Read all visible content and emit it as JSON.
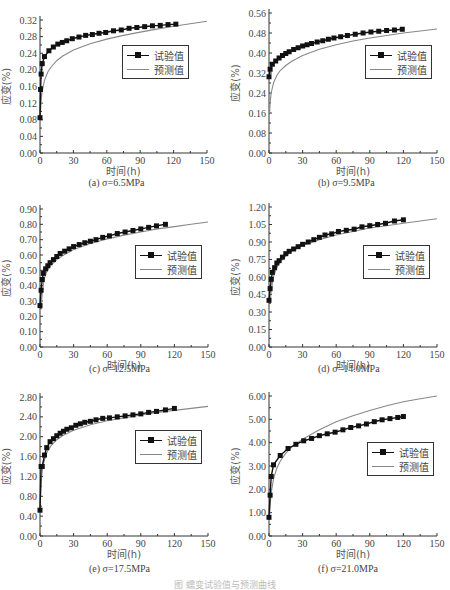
{
  "figure_caption": "图    蠕变试验值与预测曲线",
  "legend": {
    "experimental": "试验值",
    "predicted": "预测值"
  },
  "colors": {
    "experimental": "#111111",
    "predicted": "#888888",
    "axis": "#333333"
  },
  "panels": [
    {
      "caption_prefix": "(a)",
      "caption_sigma": "σ=6.5MPa",
      "ylabel": "应变(%)",
      "xlabel": "时间(h)"
    },
    {
      "caption_prefix": "(b)",
      "caption_sigma": "σ=9.5MPa",
      "ylabel": "应变(%)",
      "xlabel": "时间(h)"
    },
    {
      "caption_prefix": "(c)",
      "caption_sigma": "σ=12.5MPa",
      "ylabel": "应变(%)",
      "xlabel": "时间(h)"
    },
    {
      "caption_prefix": "(d)",
      "caption_sigma": "σ=14.0MPa",
      "ylabel": "应变(%)",
      "xlabel": "时间(h)"
    },
    {
      "caption_prefix": "(e)",
      "caption_sigma": "σ=17.5MPa",
      "ylabel": "应变(%)",
      "xlabel": "时间(h)"
    },
    {
      "caption_prefix": "(f)",
      "caption_sigma": "σ=21.0MPa",
      "ylabel": "应变(%)",
      "xlabel": "时间(h)"
    }
  ],
  "chart_data": [
    {
      "type": "line",
      "title": "(a) σ=6.5MPa",
      "xlabel": "时间(h)",
      "ylabel": "应变(%)",
      "xlim": [
        0,
        150
      ],
      "ylim": [
        0,
        0.32
      ],
      "xticks": [
        0,
        30,
        60,
        90,
        120,
        150
      ],
      "yticks": [
        0.0,
        0.04,
        0.08,
        0.12,
        0.16,
        0.2,
        0.24,
        0.28,
        0.32
      ],
      "ytick_labels": [
        "0.00",
        "0.04",
        "0.08",
        "0.12",
        "0.16",
        "0.20",
        "0.24",
        "0.28",
        "0.32"
      ],
      "grid": false,
      "legend_position": "right-middle",
      "series": [
        {
          "name": "试验值",
          "marker": "square",
          "x": [
            0,
            0.5,
            1,
            2,
            4,
            8,
            12,
            16,
            20,
            24,
            29,
            35,
            41,
            47,
            53,
            59,
            66,
            73,
            80,
            87,
            94,
            101,
            108,
            115,
            122
          ],
          "y": [
            0.085,
            0.153,
            0.19,
            0.215,
            0.232,
            0.246,
            0.255,
            0.262,
            0.266,
            0.27,
            0.275,
            0.279,
            0.283,
            0.285,
            0.288,
            0.29,
            0.294,
            0.296,
            0.3,
            0.302,
            0.304,
            0.306,
            0.307,
            0.309,
            0.31
          ]
        },
        {
          "name": "预测值",
          "x": [
            0.5,
            1,
            2,
            4,
            7,
            10,
            15,
            20,
            30,
            45,
            60,
            75,
            90,
            105,
            120,
            135,
            150
          ],
          "y": [
            0.1,
            0.125,
            0.15,
            0.175,
            0.195,
            0.207,
            0.222,
            0.233,
            0.248,
            0.263,
            0.274,
            0.283,
            0.291,
            0.298,
            0.305,
            0.311,
            0.317
          ]
        }
      ]
    },
    {
      "type": "line",
      "title": "(b) σ=9.5MPa",
      "xlabel": "时间(h)",
      "ylabel": "应变(%)",
      "xlim": [
        0,
        150
      ],
      "ylim": [
        0,
        0.56
      ],
      "xticks": [
        0,
        30,
        60,
        90,
        120,
        150
      ],
      "yticks": [
        0.0,
        0.08,
        0.16,
        0.24,
        0.32,
        0.4,
        0.48,
        0.56
      ],
      "ytick_labels": [
        "0.00",
        "0.08",
        "0.16",
        "0.24",
        "0.32",
        "0.40",
        "0.48",
        "0.56"
      ],
      "grid": false,
      "legend_position": "right-middle",
      "series": [
        {
          "name": "试验值",
          "marker": "square",
          "x": [
            0,
            1,
            3,
            6,
            9,
            12,
            15,
            18,
            22,
            26,
            30,
            34,
            38,
            43,
            48,
            53,
            58,
            64,
            70,
            77,
            84,
            91,
            98,
            105,
            112,
            119
          ],
          "y": [
            0.305,
            0.335,
            0.355,
            0.368,
            0.38,
            0.39,
            0.398,
            0.405,
            0.414,
            0.421,
            0.428,
            0.433,
            0.438,
            0.444,
            0.449,
            0.455,
            0.46,
            0.465,
            0.47,
            0.475,
            0.48,
            0.484,
            0.487,
            0.49,
            0.492,
            0.495
          ]
        },
        {
          "name": "预测值",
          "x": [
            0.5,
            1,
            2,
            4,
            7,
            10,
            15,
            20,
            30,
            45,
            60,
            75,
            90,
            105,
            120,
            135,
            150
          ],
          "y": [
            0.16,
            0.2,
            0.24,
            0.28,
            0.31,
            0.33,
            0.35,
            0.366,
            0.39,
            0.415,
            0.433,
            0.448,
            0.46,
            0.47,
            0.48,
            0.488,
            0.496
          ]
        }
      ]
    },
    {
      "type": "line",
      "title": "(c) σ=12.5MPa",
      "xlabel": "时间(h)",
      "ylabel": "应变(%)",
      "xlim": [
        0,
        150
      ],
      "ylim": [
        0,
        0.9
      ],
      "xticks": [
        0,
        30,
        60,
        90,
        120,
        150
      ],
      "yticks": [
        0.0,
        0.1,
        0.2,
        0.3,
        0.4,
        0.5,
        0.6,
        0.7,
        0.8,
        0.9
      ],
      "ytick_labels": [
        "0.00",
        "0.10",
        "0.20",
        "0.30",
        "0.40",
        "0.50",
        "0.60",
        "0.70",
        "0.80",
        "0.90"
      ],
      "grid": false,
      "legend_position": "right-middle",
      "series": [
        {
          "name": "试验值",
          "marker": "square",
          "x": [
            0,
            1,
            2,
            3,
            5,
            7,
            9,
            12,
            15,
            18,
            22,
            26,
            30,
            35,
            40,
            45,
            50,
            56,
            62,
            69,
            76,
            83,
            90,
            97,
            104,
            112
          ],
          "y": [
            0.27,
            0.37,
            0.44,
            0.48,
            0.51,
            0.53,
            0.55,
            0.57,
            0.59,
            0.61,
            0.625,
            0.64,
            0.655,
            0.668,
            0.68,
            0.69,
            0.7,
            0.715,
            0.725,
            0.74,
            0.75,
            0.76,
            0.77,
            0.78,
            0.79,
            0.8
          ]
        },
        {
          "name": "预测值",
          "x": [
            1,
            2,
            3,
            4,
            6,
            8,
            10,
            15,
            20,
            30,
            45,
            60,
            75,
            90,
            105,
            120,
            135,
            150
          ],
          "y": [
            0.25,
            0.35,
            0.41,
            0.45,
            0.49,
            0.515,
            0.535,
            0.57,
            0.595,
            0.635,
            0.675,
            0.705,
            0.73,
            0.75,
            0.77,
            0.785,
            0.8,
            0.815
          ]
        }
      ]
    },
    {
      "type": "line",
      "title": "(d) σ=14.0MPa",
      "xlabel": "时间(h)",
      "ylabel": "应变(%)",
      "xlim": [
        0,
        150
      ],
      "ylim": [
        0,
        1.2
      ],
      "xticks": [
        0,
        30,
        60,
        90,
        120,
        150
      ],
      "yticks": [
        0.0,
        0.15,
        0.3,
        0.45,
        0.6,
        0.75,
        0.9,
        1.05,
        1.2
      ],
      "ytick_labels": [
        "0.00",
        "0.15",
        "0.30",
        "0.45",
        "0.60",
        "0.75",
        "0.90",
        "1.05",
        "1.20"
      ],
      "grid": false,
      "legend_position": "right-middle",
      "series": [
        {
          "name": "试验值",
          "marker": "square",
          "x": [
            0,
            1,
            2,
            3,
            5,
            7,
            9,
            12,
            15,
            18,
            22,
            26,
            30,
            35,
            40,
            45,
            50,
            56,
            62,
            69,
            76,
            83,
            90,
            97,
            104,
            112,
            120
          ],
          "y": [
            0.4,
            0.5,
            0.58,
            0.64,
            0.68,
            0.72,
            0.74,
            0.77,
            0.8,
            0.82,
            0.84,
            0.86,
            0.88,
            0.9,
            0.92,
            0.94,
            0.96,
            0.97,
            0.99,
            1.0,
            1.01,
            1.03,
            1.04,
            1.05,
            1.06,
            1.08,
            1.09
          ]
        },
        {
          "name": "预测值",
          "x": [
            1,
            2,
            3,
            4,
            6,
            8,
            10,
            15,
            20,
            30,
            45,
            60,
            75,
            90,
            105,
            120,
            135,
            150
          ],
          "y": [
            0.38,
            0.48,
            0.55,
            0.6,
            0.66,
            0.7,
            0.73,
            0.78,
            0.82,
            0.87,
            0.92,
            0.96,
            0.99,
            1.02,
            1.04,
            1.06,
            1.08,
            1.1
          ]
        }
      ]
    },
    {
      "type": "line",
      "title": "(e) σ=17.5MPa",
      "xlabel": "时间(h)",
      "ylabel": "应变(%)",
      "xlim": [
        0,
        150
      ],
      "ylim": [
        0,
        2.8
      ],
      "xticks": [
        0,
        30,
        60,
        90,
        120,
        150
      ],
      "yticks": [
        0.0,
        0.4,
        0.8,
        1.2,
        1.6,
        2.0,
        2.4,
        2.8
      ],
      "ytick_labels": [
        "0.00",
        "0.40",
        "0.80",
        "1.20",
        "1.60",
        "2.00",
        "2.40",
        "2.80"
      ],
      "grid": false,
      "legend_position": "right-middle",
      "series": [
        {
          "name": "试验值",
          "marker": "square",
          "x": [
            0,
            1,
            2,
            4,
            6,
            9,
            12,
            15,
            18,
            21,
            24,
            28,
            32,
            36,
            40,
            45,
            50,
            56,
            62,
            69,
            76,
            83,
            90,
            97,
            104,
            112,
            120
          ],
          "y": [
            0.52,
            1.4,
            1.4,
            1.63,
            1.78,
            1.9,
            1.96,
            2.02,
            2.07,
            2.11,
            2.15,
            2.18,
            2.23,
            2.26,
            2.29,
            2.31,
            2.34,
            2.37,
            2.38,
            2.4,
            2.42,
            2.44,
            2.46,
            2.49,
            2.51,
            2.54,
            2.57
          ]
        },
        {
          "name": "预测值",
          "x": [
            0.5,
            1,
            2,
            3,
            5,
            7,
            10,
            15,
            20,
            30,
            45,
            60,
            75,
            90,
            105,
            120,
            135,
            150
          ],
          "y": [
            0.8,
            1.05,
            1.3,
            1.45,
            1.62,
            1.72,
            1.82,
            1.94,
            2.02,
            2.13,
            2.24,
            2.32,
            2.38,
            2.44,
            2.49,
            2.53,
            2.57,
            2.61
          ]
        }
      ]
    },
    {
      "type": "line",
      "title": "(f) σ=21.0MPa",
      "xlabel": "时间(h)",
      "ylabel": "应变(%)",
      "xlim": [
        0,
        150
      ],
      "ylim": [
        0,
        6.0
      ],
      "xticks": [
        0,
        30,
        60,
        90,
        120,
        150
      ],
      "yticks": [
        0.0,
        1.0,
        2.0,
        3.0,
        4.0,
        5.0,
        6.0
      ],
      "ytick_labels": [
        "0.00",
        "1.00",
        "2.00",
        "3.00",
        "4.00",
        "5.00",
        "6.00"
      ],
      "grid": false,
      "legend_position": "right-middle",
      "series": [
        {
          "name": "试验值",
          "marker": "square",
          "x": [
            0,
            1,
            2,
            4,
            10,
            17,
            24,
            31,
            38,
            45,
            52,
            59,
            66,
            73,
            80,
            87,
            94,
            101,
            108,
            115,
            120
          ],
          "y": [
            0.8,
            1.75,
            2.55,
            3.05,
            3.45,
            3.75,
            3.93,
            4.08,
            4.18,
            4.3,
            4.38,
            4.45,
            4.55,
            4.65,
            4.72,
            4.8,
            4.9,
            4.98,
            5.03,
            5.08,
            5.12
          ]
        },
        {
          "name": "预测值",
          "x": [
            0.5,
            1,
            2,
            4,
            7,
            10,
            15,
            20,
            30,
            45,
            60,
            75,
            90,
            105,
            120,
            135,
            150
          ],
          "y": [
            0.9,
            1.3,
            1.85,
            2.45,
            2.9,
            3.2,
            3.55,
            3.8,
            4.15,
            4.55,
            4.9,
            5.15,
            5.38,
            5.58,
            5.75,
            5.88,
            6.0
          ]
        }
      ]
    }
  ]
}
